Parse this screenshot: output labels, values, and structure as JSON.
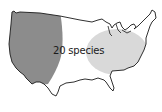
{
  "map": {
    "label": "20 species",
    "regions": [
      {
        "name": "western-range",
        "color": "#8c8c8c"
      },
      {
        "name": "eastern-range",
        "color": "#d9d9d9"
      }
    ],
    "outline_color": "#1a1a1a",
    "background": "#ffffff"
  }
}
